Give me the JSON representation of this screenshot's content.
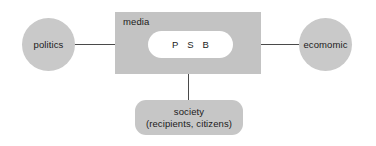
{
  "diagram": {
    "background_color": "#ffffff",
    "line_color": "#4a4a4a",
    "nodes": {
      "politics": {
        "label": "politics",
        "shape": "circle",
        "fill": "#c9c9c9"
      },
      "economic": {
        "label": "ecomomic",
        "shape": "circle",
        "fill": "#c9c9c9"
      },
      "media": {
        "label": "media",
        "shape": "rectangle",
        "fill": "#c3c3c3"
      },
      "psb": {
        "label": "P S B",
        "shape": "pill",
        "fill": "#ffffff"
      },
      "society": {
        "label_line1": "society",
        "label_line2": "(recipients, citizens)",
        "shape": "rounded-rectangle",
        "fill": "#c6c6c6"
      }
    }
  }
}
